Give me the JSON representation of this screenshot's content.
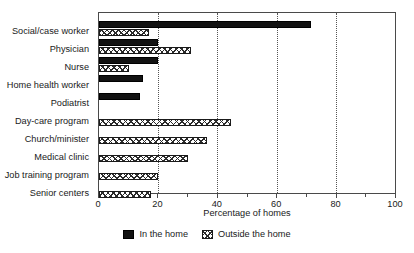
{
  "chart_data": {
    "type": "bar",
    "orientation": "horizontal",
    "title": "",
    "xlabel": "Percentage of homes",
    "ylabel": "",
    "xlim": [
      0,
      100
    ],
    "xticks": [
      0,
      20,
      40,
      60,
      80,
      100
    ],
    "xticklabels": [
      "0",
      "20",
      "40",
      "60",
      "80",
      "100"
    ],
    "minor_tick_interval": 10,
    "grid": "vertical dotted gridlines at 20, 40, 60, 80",
    "legend_position": "below axis, centered",
    "categories": [
      "Social/case worker",
      "Physician",
      "Nurse",
      "Home health worker",
      "Podiatrist",
      "Day-care program",
      "Church/minister",
      "Medical clinic",
      "Job training program",
      "Senior centers"
    ],
    "series": [
      {
        "name": "In the home",
        "fill": "solid-black",
        "values": [
          71.5,
          20,
          20,
          15,
          14,
          0,
          0,
          0,
          0,
          0
        ]
      },
      {
        "name": "Outside the home",
        "fill": "cross-hatch",
        "values": [
          17,
          31,
          10,
          0,
          0,
          44.5,
          36.5,
          30,
          20,
          17.5
        ]
      }
    ]
  },
  "legend": {
    "items": [
      {
        "label": "In the home",
        "swatch": "solid-black-swatch"
      },
      {
        "label": "Outside the home",
        "swatch": "cross-hatch-swatch"
      }
    ]
  },
  "colors": {
    "solid_fill": "#121212",
    "hatch_line": "#2b2b2b",
    "axis": "#4a4a4a",
    "text": "#1a1a1a",
    "background": "#ffffff"
  }
}
